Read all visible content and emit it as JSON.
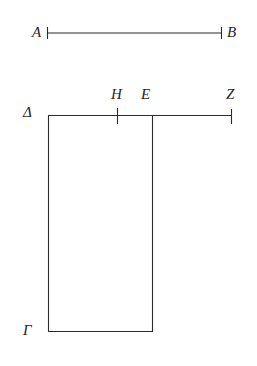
{
  "figure": {
    "background_color": "#ffffff",
    "stroke_color": "#2b2b2b",
    "label_color": "#262626",
    "width": 257,
    "height": 366,
    "upper_figure": {
      "name": "segment-ab",
      "description": "Horizontal straight line segment with end ticks",
      "labels": [
        {
          "id": "A",
          "text": "A",
          "x": 32,
          "y": 25
        },
        {
          "id": "B",
          "text": "B",
          "x": 227,
          "y": 25
        }
      ],
      "geometry": {
        "line_y": 33,
        "x_start": 47,
        "x_end": 222,
        "tick_half_height": 6
      }
    },
    "lower_figure": {
      "name": "rectangle-with-extended-top",
      "description": "Rectangle Gamma-Delta with top edge extended rightward to Z, tick at H and division at E",
      "labels": [
        {
          "id": "Delta",
          "text": "Δ",
          "x": 23,
          "y": 105
        },
        {
          "id": "H",
          "text": "H",
          "x": 111,
          "y": 87
        },
        {
          "id": "E",
          "text": "E",
          "x": 141,
          "y": 87
        },
        {
          "id": "Z",
          "text": "Z",
          "x": 226,
          "y": 87
        },
        {
          "id": "Gamma",
          "text": "Γ",
          "x": 23,
          "y": 323
        }
      ],
      "geometry": {
        "top_y": 115,
        "bottom_y": 332,
        "left_x": 48,
        "rect_right_x": 153,
        "line_right_x": 232,
        "tick_h_x": 117,
        "tick_h_top": 108,
        "tick_h_bottom": 124,
        "tick_z_top": 109,
        "tick_z_bottom": 124
      }
    }
  }
}
